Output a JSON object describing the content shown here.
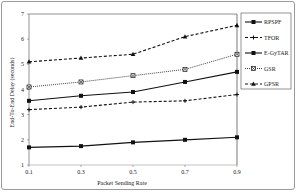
{
  "chart_data": {
    "type": "line",
    "title": "",
    "xlabel": "Packet Sending Rate",
    "ylabel": "End-To-End Delay (seconds)",
    "x": [
      0.1,
      0.3,
      0.5,
      0.7,
      0.9
    ],
    "x_tick_labels": [
      "0.1",
      "0.3",
      "0.5",
      "0.7",
      "0.9"
    ],
    "y_tick_labels": [
      "1",
      "2",
      "3",
      "4",
      "5",
      "6",
      "7"
    ],
    "ylim": [
      1,
      7
    ],
    "xlim": [
      0.1,
      0.9
    ],
    "grid": false,
    "legend_position": "right",
    "series": [
      {
        "name": "RPSPF",
        "values": [
          1.7,
          1.75,
          1.9,
          2.0,
          2.1
        ],
        "style": "solid",
        "marker": "square"
      },
      {
        "name": "TFOR",
        "values": [
          3.2,
          3.3,
          3.5,
          3.55,
          3.8
        ],
        "style": "dashed",
        "marker": "plus"
      },
      {
        "name": "E-GyTAR",
        "values": [
          3.55,
          3.75,
          3.9,
          4.3,
          4.7
        ],
        "style": "solid",
        "marker": "square"
      },
      {
        "name": "GSR",
        "values": [
          4.1,
          4.3,
          4.55,
          4.8,
          5.4
        ],
        "style": "dotted",
        "marker": "x-square"
      },
      {
        "name": "GPSR",
        "values": [
          5.1,
          5.25,
          5.4,
          6.1,
          6.55
        ],
        "style": "dashed",
        "marker": "triangle"
      }
    ]
  }
}
